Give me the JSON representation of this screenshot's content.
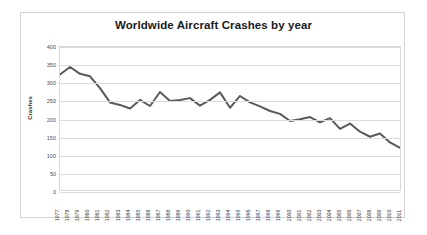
{
  "chart_data": {
    "type": "line",
    "title": "Worldwide Aircraft Crashes by year",
    "xlabel": "",
    "ylabel": "Crashes",
    "ylim": [
      0,
      400
    ],
    "ytick_step": 50,
    "yticks": [
      400,
      350,
      300,
      250,
      200,
      150,
      100,
      50,
      0
    ],
    "grid": true,
    "legend": false,
    "line_color": "#595959",
    "categories": [
      "1977",
      "1978",
      "1979",
      "1980",
      "1981",
      "1982",
      "1983",
      "1984",
      "1985",
      "1986",
      "1987",
      "1988",
      "1989",
      "1990",
      "1991",
      "1992",
      "1993",
      "1994",
      "1995",
      "1996",
      "1997",
      "1998",
      "1999",
      "2000",
      "2001",
      "2002",
      "2003",
      "2004",
      "2005",
      "2006",
      "2007",
      "2008",
      "2009",
      "2010",
      "2011"
    ],
    "values": [
      323,
      344,
      325,
      318,
      285,
      245,
      238,
      228,
      252,
      235,
      274,
      249,
      252,
      257,
      236,
      252,
      273,
      230,
      263,
      245,
      234,
      221,
      213,
      193,
      198,
      204,
      189,
      201,
      171,
      186,
      163,
      149,
      158,
      133,
      118
    ],
    "series_name": "Crashes"
  },
  "figure": {
    "background": "#ffffff",
    "frame_color": "#d4d4d4"
  }
}
